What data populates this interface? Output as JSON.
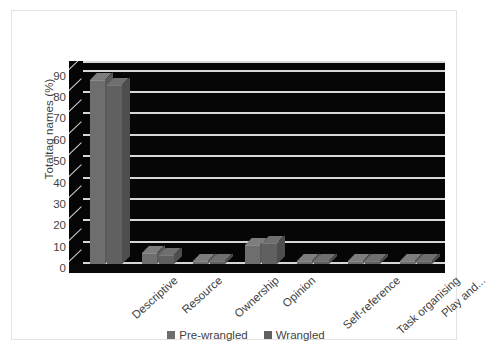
{
  "chart_data": {
    "type": "bar",
    "title": "",
    "subtitle": "",
    "xlabel": "",
    "ylabel": "Totaltag names (%)",
    "ylim": [
      0,
      95
    ],
    "ytick_step": 10,
    "ytick_labels": [
      "0",
      "10",
      "20",
      "30",
      "40",
      "50",
      "60",
      "70",
      "80",
      "90"
    ],
    "ytick_values": [
      0,
      10,
      20,
      30,
      40,
      50,
      60,
      70,
      80,
      90
    ],
    "grid": true,
    "grid_axis": "y",
    "legend_position": "bottom",
    "style": "3d-column",
    "plot_background": "#060606",
    "categories": [
      "Descriptive",
      "Resource",
      "Ownership",
      "Opinion",
      "Self-reference",
      "Task organising",
      "Play and..."
    ],
    "series": [
      {
        "name": "Pre-wrangled",
        "color": "#6e6e6e",
        "values": [
          86,
          5,
          0,
          9,
          0,
          0,
          0
        ]
      },
      {
        "name": "Wrangled",
        "color": "#606060",
        "values": [
          84,
          4,
          1,
          10,
          1,
          1,
          1
        ]
      }
    ],
    "annotations": []
  },
  "legend": {
    "items": [
      {
        "label": "Pre-wrangled",
        "color": "#6e6e6e"
      },
      {
        "label": "Wrangled",
        "color": "#606060"
      }
    ]
  }
}
